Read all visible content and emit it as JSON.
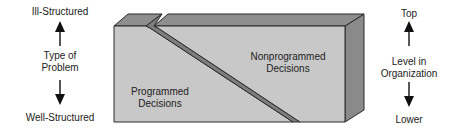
{
  "diagram": {
    "type": "block-split",
    "left_axis": {
      "top_label": "Ill-Structured",
      "middle_label_line1": "Type of",
      "middle_label_line2": "Problem",
      "bottom_label": "Well-Structured"
    },
    "right_axis": {
      "top_label": "Top",
      "middle_label_line1": "Level in",
      "middle_label_line2": "Organization",
      "bottom_label": "Lower"
    },
    "block": {
      "left_region_line1": "Programmed",
      "left_region_line2": "Decisions",
      "right_region_line1": "Nonprogrammed",
      "right_region_line2": "Decisions"
    },
    "colors": {
      "front_face": "#c8c8c8",
      "top_face": "#8e8e8e",
      "side_face": "#8a8a8a",
      "groove": "#7d7d7d",
      "edge": "#2a2a2a"
    }
  }
}
